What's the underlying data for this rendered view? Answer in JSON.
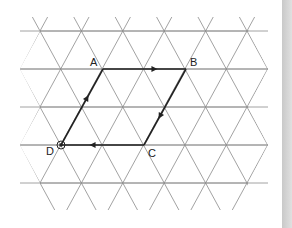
{
  "diagram": {
    "type": "triangular-grid-parallelogram",
    "grid": {
      "rows_y": [
        31,
        69,
        107,
        145,
        183
      ],
      "x_start": 20,
      "x_end": 268,
      "half_step": 20.7,
      "line_color": "#8a8a8a"
    },
    "points": [
      {
        "label": "A",
        "x": 103,
        "y": 69,
        "label_dx": -13,
        "label_dy": -3
      },
      {
        "label": "B",
        "x": 186,
        "y": 69,
        "label_dx": 4,
        "label_dy": -3
      },
      {
        "label": "C",
        "x": 144,
        "y": 145,
        "label_dx": 4,
        "label_dy": 12
      },
      {
        "label": "D",
        "x": 61,
        "y": 145,
        "label_dx": -15,
        "label_dy": 10
      }
    ],
    "vectors": [
      {
        "from": "A",
        "to": "B"
      },
      {
        "from": "B",
        "to": "C"
      },
      {
        "from": "C",
        "to": "D"
      },
      {
        "from": "D",
        "to": "A"
      }
    ],
    "start_marker": "D",
    "path_color": "#222222"
  }
}
